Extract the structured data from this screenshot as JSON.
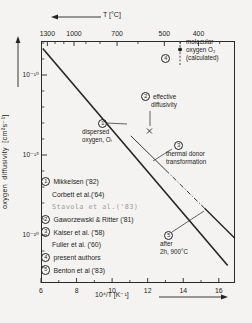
{
  "colors": {
    "ink": "#242422",
    "gray_text": "#9b9b9b",
    "paper": "#f4f3f1"
  },
  "chart_data": {
    "type": "line",
    "title": "",
    "top_axis": {
      "title": "T [°C]",
      "tick_labels": [
        "1300",
        "1000",
        "700",
        "500",
        "400"
      ],
      "tick_temps_c": [
        1300,
        1000,
        700,
        500,
        400
      ],
      "minor_temps_c": [
        1200,
        1100,
        900,
        800,
        600,
        450,
        350
      ]
    },
    "x_axis": {
      "title": "10⁴/T [K⁻¹]",
      "tick_labels": [
        "6",
        "8",
        "10",
        "12",
        "14",
        "16"
      ],
      "tick_values": [
        6,
        8,
        10,
        12,
        14,
        16
      ],
      "minor_values": [
        7,
        9,
        11,
        13,
        15
      ],
      "range": [
        6,
        16.9
      ]
    },
    "y_axis": {
      "title": "oxygen diffusivity [cm²s⁻¹]",
      "tick_labels": [
        "10⁻¹⁰",
        "10⁻¹⁵",
        "10⁻²⁰"
      ],
      "tick_values": [
        -10,
        -15,
        -20
      ],
      "minor_values": [
        -8,
        -9,
        -11,
        -12,
        -13,
        -14,
        -16,
        -17,
        -18,
        -19,
        -21,
        -22
      ],
      "range_log10": [
        -7.9,
        -23
      ]
    },
    "series": [
      {
        "name": "dispersed-oxygen-Oi",
        "label_ref": "1",
        "style": "solid",
        "width": 1.6,
        "points": [
          [
            6.1,
            -8.35
          ],
          [
            16.5,
            -21.9
          ]
        ]
      },
      {
        "name": "thermal-donor-solid",
        "label_ref": "3",
        "style": "solid",
        "width": 0.9,
        "points": [
          [
            11.05,
            -13.8
          ],
          [
            13.0,
            -15.93
          ]
        ]
      },
      {
        "name": "thermal-donor-dashdot",
        "label_ref": "3",
        "style": "dashdot",
        "width": 0.9,
        "points": [
          [
            13.0,
            -15.93
          ],
          [
            15.2,
            -18.33
          ]
        ]
      },
      {
        "name": "after-anneal-segment",
        "label_ref": "5",
        "style": "solid",
        "width": 1.4,
        "points": [
          [
            15.2,
            -18.33
          ],
          [
            16.9,
            -20.2
          ]
        ]
      }
    ],
    "markers": [
      {
        "name": "molecular-oxygen-point",
        "label_ref": "4",
        "shape": "filled-circle",
        "x": 13.82,
        "log10_D": -8.4,
        "errorbar_log10_D": [
          -7.9,
          -9.45
        ],
        "errorbar_style": "dashed"
      },
      {
        "name": "effective-diffusivity-point",
        "label_ref": "2",
        "shape": "x-cross",
        "x": 12.1,
        "log10_D": -13.5
      }
    ]
  },
  "annotations": {
    "molecular": {
      "num": "4",
      "lines": [
        "molecular",
        "oxygen O₂",
        "(calculated)"
      ]
    },
    "effective": {
      "num": "2",
      "line1": "effective",
      "line2": "diffusivity"
    },
    "dispersed": {
      "num": "1",
      "line1": "dispersed",
      "line2": "oxygen, Oᵢ"
    },
    "thermal": {
      "num": "3",
      "line1": "thermal donor",
      "line2": "transformation"
    },
    "after": {
      "num": "5",
      "line1": "after",
      "line2": "2h, 900°C"
    }
  },
  "legend": {
    "items": [
      {
        "num": "1",
        "text": "Mikkelsen ('82)"
      },
      {
        "num": "",
        "text": "Corbett et al.('64)"
      },
      {
        "num": "",
        "text": "Stavola et al.('83)"
      },
      {
        "num": "2",
        "text": "Gaworzewski & Ritter ('81)"
      },
      {
        "num": "3",
        "text": "Kaiser et al. ('58)"
      },
      {
        "num": "",
        "text": "Fuller et al. ('60)"
      },
      {
        "num": "4",
        "text": "present authors"
      },
      {
        "num": "5",
        "text": "Benton et al ('83)"
      }
    ]
  }
}
